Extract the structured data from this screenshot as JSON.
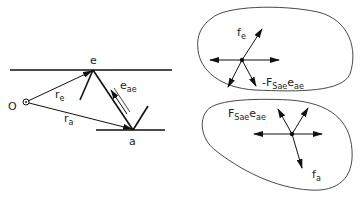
{
  "left_diagram": {
    "point_e": "e",
    "point_a": "a",
    "origin": "O",
    "r_e": {
      "main": "r",
      "sub": "e"
    },
    "r_a": {
      "main": "r",
      "sub": "a"
    },
    "e_ae": {
      "main": "e",
      "sub": "ae"
    }
  },
  "top_body": {
    "f_e": {
      "main": "f",
      "sub": "e"
    },
    "neg_force": {
      "prefix": "-F",
      "sub1": "Sae",
      "main2": "e",
      "sub2": "ae"
    }
  },
  "bottom_body": {
    "pos_force": {
      "prefix": "F",
      "sub1": "Sae",
      "main2": "e",
      "sub2": "ae"
    },
    "f_a": {
      "main": "f",
      "sub": "a"
    }
  }
}
